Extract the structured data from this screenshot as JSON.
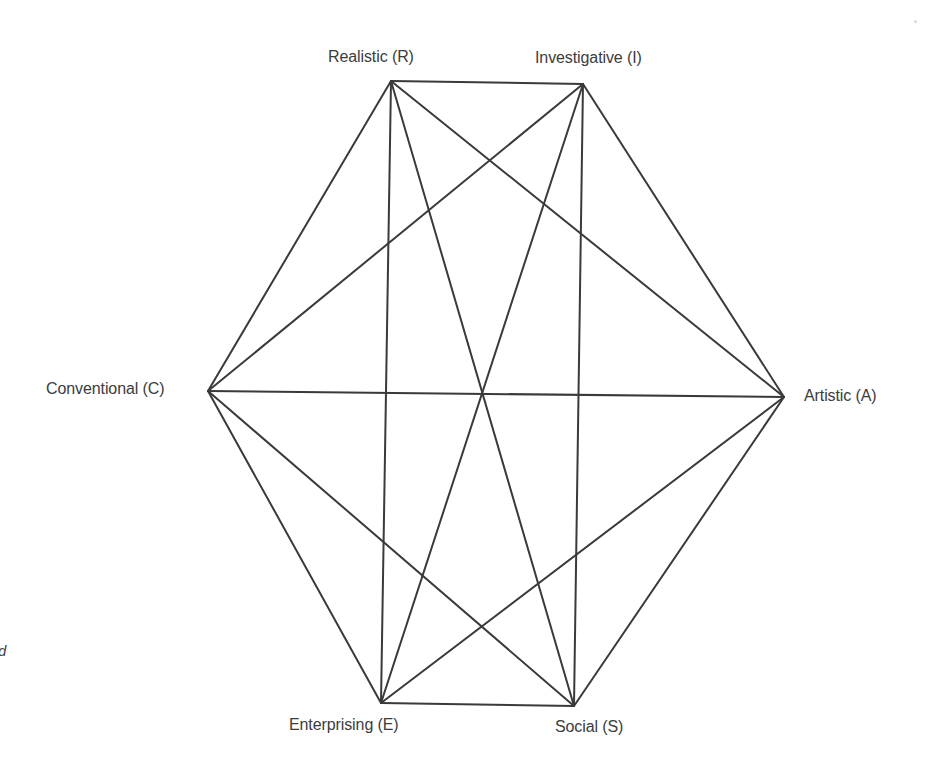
{
  "diagram": {
    "title": "",
    "line_color": "#3a3a3a",
    "text_color": "#3c3c3c",
    "background": "#ffffff",
    "nodes": [
      {
        "id": "R",
        "label": "Realistic (R)",
        "x": 391,
        "y": 81
      },
      {
        "id": "I",
        "label": "Investigative (I)",
        "x": 583,
        "y": 84
      },
      {
        "id": "A",
        "label": "Artistic (A)",
        "x": 784,
        "y": 397
      },
      {
        "id": "S",
        "label": "Social (S)",
        "x": 574,
        "y": 706
      },
      {
        "id": "E",
        "label": "Enterprising (E)",
        "x": 381,
        "y": 703
      },
      {
        "id": "C",
        "label": "Conventional (C)",
        "x": 208,
        "y": 391
      }
    ],
    "edges": [
      [
        "R",
        "I"
      ],
      [
        "R",
        "A"
      ],
      [
        "R",
        "S"
      ],
      [
        "R",
        "E"
      ],
      [
        "R",
        "C"
      ],
      [
        "I",
        "A"
      ],
      [
        "I",
        "S"
      ],
      [
        "I",
        "E"
      ],
      [
        "I",
        "C"
      ],
      [
        "A",
        "S"
      ],
      [
        "A",
        "E"
      ],
      [
        "A",
        "C"
      ],
      [
        "S",
        "E"
      ],
      [
        "S",
        "C"
      ],
      [
        "E",
        "C"
      ]
    ],
    "fragment_text": "d"
  }
}
